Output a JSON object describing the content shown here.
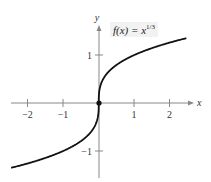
{
  "chart_data": {
    "type": "line",
    "function_label": {
      "prefix": "f(x) = x",
      "exponent": "1/3"
    },
    "xlabel": "x",
    "ylabel": "y",
    "xlim": [
      -2.5,
      2.5
    ],
    "ylim": [
      -1.5,
      1.5
    ],
    "x_ticks": [
      -2,
      -1,
      1,
      2
    ],
    "x_tick_labels": [
      "−2",
      "−1",
      "1",
      "2"
    ],
    "y_ticks": [
      1,
      -1
    ],
    "y_tick_labels": [
      "1",
      "−1"
    ],
    "grid": false,
    "series": [
      {
        "name": "f(x) = x^(1/3)",
        "x": [
          -2.46,
          -2,
          -1.5,
          -1,
          -0.5,
          -0.2,
          -0.05,
          -0.01,
          0,
          0.01,
          0.05,
          0.2,
          0.5,
          1,
          1.5,
          2,
          2.46
        ],
        "y": [
          -1.35,
          -1.26,
          -1.14,
          -1,
          -0.79,
          -0.585,
          -0.368,
          -0.215,
          0,
          0.215,
          0.368,
          0.585,
          0.79,
          1,
          1.14,
          1.26,
          1.35
        ],
        "color": "#111111"
      }
    ],
    "highlighted_points": [
      {
        "x": 0,
        "y": 0
      }
    ],
    "colors": {
      "curve": "#111111",
      "axis": "#888888",
      "label_bg": "#f2f2f2"
    }
  }
}
